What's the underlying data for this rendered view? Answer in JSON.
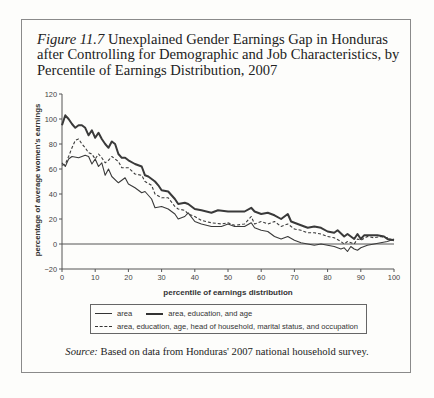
{
  "figure": {
    "label": "Figure 11.7",
    "title": "Unexplained Gender Earnings Gap in Honduras after Controlling for Demographic and Job Characteristics, by Percentile of Earnings Distribution, 2007",
    "source_label": "Source:",
    "source_text": "Based on data from Honduras' 2007 national household survey."
  },
  "legend": {
    "area": "area",
    "area_edu_age": "area, education, and age",
    "full": "area, education, age, head of household, marital status, and occupation"
  },
  "chart_data": {
    "type": "line",
    "title": "Unexplained Gender Earnings Gap in Honduras after Controlling for Demographic and Job Characteristics, by Percentile of Earnings Distribution, 2007",
    "xlabel": "percentile of earnings distribution",
    "ylabel": "percentage of average women's earnings",
    "xlim": [
      0,
      100
    ],
    "ylim": [
      -20,
      120
    ],
    "xticks": [
      0,
      10,
      20,
      30,
      40,
      50,
      60,
      70,
      80,
      90,
      100
    ],
    "yticks": [
      -20,
      0,
      20,
      40,
      60,
      80,
      100,
      120
    ],
    "grid": false,
    "legend_position": "bottom",
    "reference_line_y": 0,
    "series": [
      {
        "name": "area",
        "style": "thin-solid",
        "x": [
          0,
          1,
          2,
          3,
          5,
          7,
          8,
          9,
          10,
          11,
          12,
          13,
          14,
          15,
          17,
          18,
          19,
          20,
          22,
          24,
          25,
          27,
          28,
          30,
          32,
          34,
          35,
          37,
          38,
          40,
          42,
          45,
          48,
          50,
          52,
          55,
          57,
          58,
          60,
          62,
          64,
          66,
          68,
          70,
          72,
          74,
          76,
          78,
          80,
          82,
          84,
          85,
          86,
          87,
          88,
          89,
          90,
          92,
          94,
          96,
          98,
          100
        ],
        "values": [
          65,
          62,
          68,
          70,
          69,
          71,
          70,
          64,
          68,
          62,
          65,
          55,
          60,
          54,
          49,
          51,
          53,
          48,
          45,
          41,
          42,
          36,
          29,
          30,
          28,
          24,
          20,
          22,
          25,
          18,
          16,
          14,
          14,
          16,
          14,
          14,
          17,
          13,
          11,
          10,
          6,
          4,
          6,
          3,
          1,
          0,
          -1,
          0,
          -1,
          -2,
          -4,
          -3,
          -6,
          -2,
          -4,
          -5,
          -3,
          -1,
          0,
          1,
          2,
          4
        ]
      },
      {
        "name": "area, education, and age",
        "style": "thick-solid",
        "x": [
          0,
          1,
          2,
          3,
          4,
          5,
          6,
          7,
          8,
          9,
          10,
          11,
          12,
          13,
          14,
          15,
          16,
          17,
          18,
          19,
          20,
          22,
          24,
          25,
          26,
          28,
          29,
          30,
          32,
          34,
          35,
          37,
          38,
          40,
          42,
          45,
          47,
          50,
          53,
          55,
          57,
          58,
          60,
          62,
          64,
          66,
          68,
          69,
          70,
          72,
          74,
          76,
          78,
          80,
          82,
          83,
          85,
          86,
          88,
          89,
          90,
          91,
          93,
          95,
          97,
          98,
          100
        ],
        "values": [
          95,
          103,
          100,
          96,
          93,
          95,
          95,
          93,
          87,
          91,
          85,
          89,
          84,
          80,
          77,
          82,
          80,
          72,
          69,
          69,
          67,
          64,
          62,
          55,
          54,
          50,
          47,
          43,
          42,
          36,
          32,
          33,
          32,
          28,
          27,
          25,
          27,
          26,
          26,
          26,
          29,
          26,
          24,
          25,
          23,
          20,
          24,
          18,
          17,
          15,
          13,
          14,
          13,
          10,
          9,
          11,
          6,
          8,
          4,
          8,
          4,
          7,
          7,
          7,
          6,
          4,
          3
        ]
      },
      {
        "name": "area, education, age, head of household, marital status, and occupation",
        "style": "dashed",
        "x": [
          0,
          1,
          2,
          3,
          4,
          5,
          6,
          7,
          8,
          9,
          10,
          11,
          12,
          13,
          14,
          15,
          17,
          18,
          20,
          22,
          24,
          25,
          27,
          28,
          30,
          32,
          34,
          35,
          37,
          38,
          40,
          42,
          45,
          48,
          50,
          52,
          55,
          57,
          58,
          60,
          62,
          64,
          66,
          68,
          70,
          72,
          74,
          76,
          78,
          80,
          82,
          84,
          85,
          86,
          88,
          89,
          90,
          92,
          94,
          96,
          98,
          100
        ],
        "values": [
          63,
          64,
          70,
          77,
          83,
          84,
          80,
          77,
          73,
          72,
          68,
          72,
          69,
          65,
          67,
          70,
          66,
          61,
          61,
          56,
          55,
          50,
          47,
          40,
          37,
          37,
          30,
          28,
          27,
          24,
          22,
          19,
          17,
          16,
          17,
          15,
          16,
          22,
          16,
          18,
          16,
          18,
          14,
          16,
          12,
          11,
          9,
          9,
          8,
          6,
          5,
          2,
          0,
          2,
          0,
          4,
          3,
          6,
          5,
          6,
          5,
          2
        ]
      }
    ]
  },
  "axes": {
    "xlabel": "percentile of earnings distribution",
    "ylabel": "percentage of average women's earnings"
  }
}
